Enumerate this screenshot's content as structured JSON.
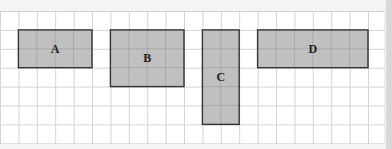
{
  "diagram": {
    "grid": {
      "columns": 21,
      "rows": 7,
      "line_color": "#d4d4d4",
      "background": "#ffffff"
    },
    "fill_color": "#c0c0c0",
    "border_color": "#333333",
    "rectangles": [
      {
        "label": "A",
        "col": 1,
        "row": 1,
        "width_cells": 4,
        "height_cells": 2
      },
      {
        "label": "B",
        "col": 6,
        "row": 1,
        "width_cells": 4,
        "height_cells": 3
      },
      {
        "label": "C",
        "col": 11,
        "row": 1,
        "width_cells": 2,
        "height_cells": 5
      },
      {
        "label": "D",
        "col": 14,
        "row": 1,
        "width_cells": 6,
        "height_cells": 2
      }
    ]
  }
}
